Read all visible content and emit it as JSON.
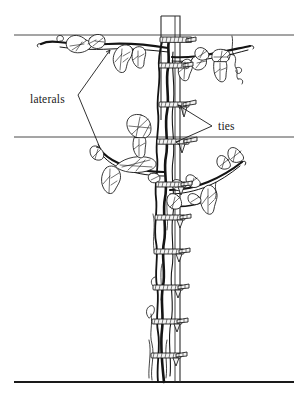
{
  "figure": {
    "background_color": "#ffffff",
    "ink_color": "#141414",
    "wire_color": "#4a4a4a",
    "width": 307,
    "height": 402
  },
  "annotations": [
    {
      "key": "laterals",
      "label": "laterals",
      "text_x": 30,
      "text_y": 99,
      "pointers": [
        {
          "from_x": 78,
          "from_y": 95,
          "to_x": 110,
          "to_y": 50
        },
        {
          "from_x": 78,
          "from_y": 95,
          "to_x": 100,
          "to_y": 148
        }
      ]
    },
    {
      "key": "ties",
      "label": "ties",
      "text_x": 218,
      "text_y": 130,
      "pointers": [
        {
          "from_x": 212,
          "from_y": 126,
          "to_x": 178,
          "to_y": 105
        },
        {
          "from_x": 212,
          "from_y": 126,
          "to_x": 176,
          "to_y": 142
        }
      ]
    }
  ],
  "wires": [
    {
      "name": "top-wire",
      "y": 35,
      "x1": 14,
      "x2": 294
    },
    {
      "name": "middle-wire",
      "y": 137,
      "x1": 14,
      "x2": 294
    }
  ],
  "ground_line": {
    "name": "ground-line",
    "y": 382,
    "x1": 14,
    "x2": 294
  },
  "stake": {
    "name": "support-stake",
    "top_y": 16,
    "left_x": 161,
    "right_x": 180,
    "post_line_x": 175,
    "bottom_y": 382
  },
  "ties_list": [
    {
      "index": 1,
      "y": 40,
      "x": 172
    },
    {
      "index": 2,
      "y": 66,
      "x": 170
    },
    {
      "index": 3,
      "y": 105,
      "x": 170
    },
    {
      "index": 4,
      "y": 142,
      "x": 168
    },
    {
      "index": 5,
      "y": 185,
      "x": 168
    },
    {
      "index": 6,
      "y": 218,
      "x": 167
    },
    {
      "index": 7,
      "y": 252,
      "x": 166
    },
    {
      "index": 8,
      "y": 288,
      "x": 165
    },
    {
      "index": 9,
      "y": 322,
      "x": 164
    },
    {
      "index": 10,
      "y": 356,
      "x": 163
    }
  ],
  "laterals_list": [
    {
      "index": 1,
      "side": "left",
      "wire": "top",
      "y": 44
    },
    {
      "index": 2,
      "side": "right",
      "wire": "top",
      "y": 50
    },
    {
      "index": 3,
      "side": "left",
      "wire": "middle",
      "y": 165
    },
    {
      "index": 4,
      "side": "right",
      "wire": "middle",
      "y": 183
    }
  ]
}
